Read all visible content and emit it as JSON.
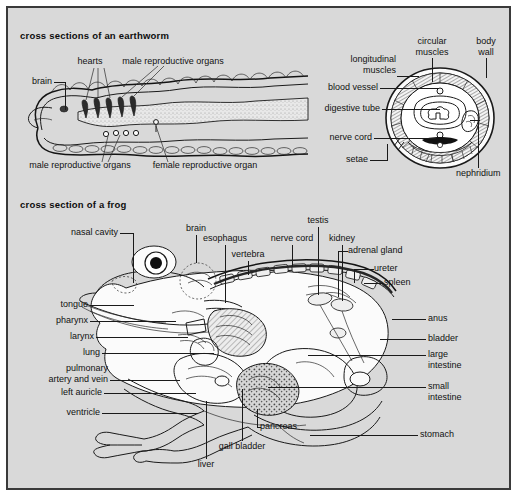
{
  "plate": {
    "background_color": "#d9d9d9",
    "border_color": "#3a3a3a",
    "ink_color": "#1a1a1a"
  },
  "figures": [
    {
      "id": "earthworm",
      "heading": "cross sections of an earthworm",
      "labels": {
        "brain": "brain",
        "hearts": "hearts",
        "male_reproductive_organs_top": "male reproductive organs",
        "male_reproductive_organs_bottom": "male reproductive organs",
        "female_reproductive_organ": "female reproductive organ",
        "longitudinal_muscles": "longitudinal\nmuscles",
        "circular_muscles": "circular\nmuscles",
        "body_wall": "body\nwall",
        "blood_vessel": "blood vessel",
        "digestive_tube": "digestive tube",
        "nerve_cord": "nerve cord",
        "setae": "setae",
        "nephridium": "nephridium"
      },
      "label_list": [
        "brain",
        "hearts",
        "male reproductive organs",
        "female reproductive organ",
        "longitudinal muscles",
        "circular muscles",
        "body wall",
        "blood vessel",
        "digestive tube",
        "nerve cord",
        "setae",
        "nephridium"
      ]
    },
    {
      "id": "frog",
      "heading": "cross section of a frog",
      "labels": {
        "nasal_cavity": "nasal cavity",
        "tongue": "tongue",
        "pharynx": "pharynx",
        "larynx": "larynx",
        "lung": "lung",
        "pulmonary_artery_and_vein": "pulmonary\nartery and vein",
        "left_auricle": "left auricle",
        "ventricle": "ventricle",
        "brain": "brain",
        "esophagus": "esophagus",
        "vertebra": "vertebra",
        "nerve_cord": "nerve cord",
        "testis": "testis",
        "kidney": "kidney",
        "adrenal_gland": "adrenal gland",
        "ureter": "ureter",
        "spleen": "spleen",
        "anus": "anus",
        "bladder": "bladder",
        "large_intestine": "large\nintestine",
        "small_intestine": "small\nintestine",
        "stomach": "stomach",
        "liver": "liver",
        "gall_bladder": "gall bladder",
        "pancreas": "pancreas"
      },
      "label_list": [
        "nasal cavity",
        "tongue",
        "pharynx",
        "larynx",
        "lung",
        "pulmonary artery and vein",
        "left auricle",
        "ventricle",
        "brain",
        "esophagus",
        "vertebra",
        "nerve cord",
        "testis",
        "kidney",
        "adrenal gland",
        "ureter",
        "spleen",
        "anus",
        "bladder",
        "large intestine",
        "small intestine",
        "stomach",
        "liver",
        "gall bladder",
        "pancreas"
      ]
    }
  ]
}
